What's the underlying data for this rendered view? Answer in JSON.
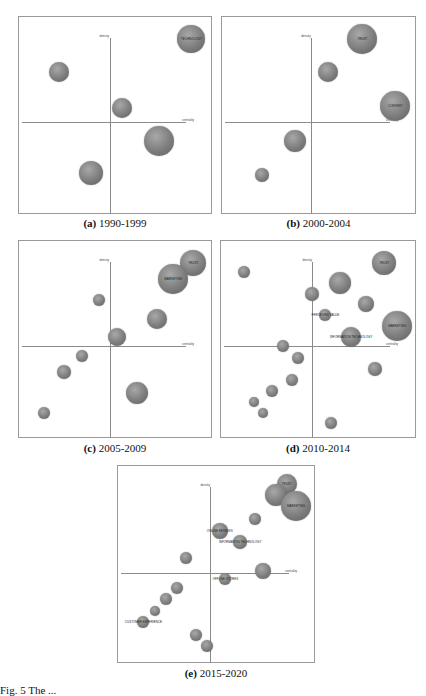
{
  "chart_data": [
    {
      "type": "scatter",
      "subtype": "strategic-diagram-bubble",
      "panel_id": "(a)",
      "title": "1990-1999",
      "xlabel": "centrality",
      "ylabel": "density",
      "grid": false,
      "points": [
        {
          "label": "TECHNOLOGY",
          "x": 0.92,
          "y": 0.09,
          "r": 14
        },
        {
          "label": "",
          "x": 0.19,
          "y": 0.27,
          "r": 10
        },
        {
          "label": "",
          "x": 0.54,
          "y": 0.46,
          "r": 10
        },
        {
          "label": "",
          "x": 0.74,
          "y": 0.64,
          "r": 15
        },
        {
          "label": "",
          "x": 0.37,
          "y": 0.81,
          "r": 12
        }
      ],
      "axis_origin": {
        "x": 0.47,
        "y": 0.54
      }
    },
    {
      "type": "scatter",
      "subtype": "strategic-diagram-bubble",
      "panel_id": "(b)",
      "title": "2000-2004",
      "xlabel": "centrality",
      "ylabel": "density",
      "grid": false,
      "points": [
        {
          "label": "TRUST",
          "x": 0.74,
          "y": 0.09,
          "r": 15
        },
        {
          "label": "",
          "x": 0.55,
          "y": 0.27,
          "r": 10
        },
        {
          "label": "CONTENT",
          "x": 0.92,
          "y": 0.45,
          "r": 15
        },
        {
          "label": "",
          "x": 0.37,
          "y": 0.64,
          "r": 11
        },
        {
          "label": "",
          "x": 0.19,
          "y": 0.82,
          "r": 7
        }
      ],
      "axis_origin": {
        "x": 0.46,
        "y": 0.54
      }
    },
    {
      "type": "scatter",
      "subtype": "strategic-diagram-bubble",
      "panel_id": "(c)",
      "title": "2005-2009",
      "xlabel": "centrality",
      "ylabel": "density",
      "grid": false,
      "points": [
        {
          "label": "TRUST",
          "x": 0.93,
          "y": 0.09,
          "r": 13
        },
        {
          "label": "MARKETING",
          "x": 0.82,
          "y": 0.18,
          "r": 15
        },
        {
          "label": "",
          "x": 0.41,
          "y": 0.29,
          "r": 6
        },
        {
          "label": "",
          "x": 0.73,
          "y": 0.39,
          "r": 10
        },
        {
          "label": "",
          "x": 0.51,
          "y": 0.49,
          "r": 9
        },
        {
          "label": "",
          "x": 0.32,
          "y": 0.59,
          "r": 6
        },
        {
          "label": "",
          "x": 0.22,
          "y": 0.68,
          "r": 7
        },
        {
          "label": "",
          "x": 0.62,
          "y": 0.79,
          "r": 11
        },
        {
          "label": "",
          "x": 0.11,
          "y": 0.9,
          "r": 6
        }
      ],
      "axis_origin": {
        "x": 0.47,
        "y": 0.54
      }
    },
    {
      "type": "scatter",
      "subtype": "strategic-diagram-bubble",
      "panel_id": "(d)",
      "title": "2010-2014",
      "xlabel": "centrality",
      "ylabel": "density",
      "grid": false,
      "points": [
        {
          "label": "TRUST",
          "x": 0.86,
          "y": 0.09,
          "r": 12
        },
        {
          "label": "",
          "x": 0.1,
          "y": 0.14,
          "r": 6
        },
        {
          "label": "",
          "x": 0.62,
          "y": 0.2,
          "r": 11
        },
        {
          "label": "",
          "x": 0.47,
          "y": 0.26,
          "r": 7
        },
        {
          "label": "",
          "x": 0.76,
          "y": 0.31,
          "r": 8
        },
        {
          "label": "PERCEIVED VALUE",
          "x": 0.54,
          "y": 0.37,
          "r": 6
        },
        {
          "label": "MARKETING",
          "x": 0.93,
          "y": 0.43,
          "r": 15
        },
        {
          "label": "INFORMATION TECHNOLOGY",
          "x": 0.68,
          "y": 0.49,
          "r": 10
        },
        {
          "label": "",
          "x": 0.31,
          "y": 0.54,
          "r": 6
        },
        {
          "label": "",
          "x": 0.39,
          "y": 0.6,
          "r": 6
        },
        {
          "label": "",
          "x": 0.81,
          "y": 0.66,
          "r": 7
        },
        {
          "label": "",
          "x": 0.36,
          "y": 0.72,
          "r": 6
        },
        {
          "label": "",
          "x": 0.25,
          "y": 0.78,
          "r": 6
        },
        {
          "label": "",
          "x": 0.15,
          "y": 0.84,
          "r": 5
        },
        {
          "label": "",
          "x": 0.2,
          "y": 0.9,
          "r": 5
        },
        {
          "label": "",
          "x": 0.57,
          "y": 0.95,
          "r": 6
        }
      ],
      "axis_origin": {
        "x": 0.47,
        "y": 0.54
      }
    },
    {
      "type": "scatter",
      "subtype": "strategic-diagram-bubble",
      "panel_id": "(e)",
      "title": "2015-2020",
      "xlabel": "centrality",
      "ylabel": "density",
      "grid": false,
      "points": [
        {
          "label": "TRUST",
          "x": 0.88,
          "y": 0.07,
          "r": 10
        },
        {
          "label": "",
          "x": 0.82,
          "y": 0.13,
          "r": 11
        },
        {
          "label": "MARKETING",
          "x": 0.93,
          "y": 0.19,
          "r": 15
        },
        {
          "label": "",
          "x": 0.71,
          "y": 0.26,
          "r": 6
        },
        {
          "label": "ONLINE REVIEWS",
          "x": 0.52,
          "y": 0.32,
          "r": 8
        },
        {
          "label": "INFORMATION TECHNOLOGY",
          "x": 0.63,
          "y": 0.38,
          "r": 7
        },
        {
          "label": "",
          "x": 0.34,
          "y": 0.47,
          "r": 6
        },
        {
          "label": "",
          "x": 0.75,
          "y": 0.54,
          "r": 8
        },
        {
          "label": "OFFLINE STORES",
          "x": 0.55,
          "y": 0.58,
          "r": 6
        },
        {
          "label": "",
          "x": 0.29,
          "y": 0.63,
          "r": 6
        },
        {
          "label": "",
          "x": 0.23,
          "y": 0.69,
          "r": 6
        },
        {
          "label": "",
          "x": 0.17,
          "y": 0.75,
          "r": 5
        },
        {
          "label": "CUSTOMER EXPERIENCE",
          "x": 0.11,
          "y": 0.81,
          "r": 6
        },
        {
          "label": "",
          "x": 0.39,
          "y": 0.88,
          "r": 6
        },
        {
          "label": "",
          "x": 0.45,
          "y": 0.94,
          "r": 6
        }
      ],
      "axis_origin": {
        "x": 0.47,
        "y": 0.55
      }
    }
  ],
  "panels": [
    {
      "id": "a",
      "caption_letter": "(a)",
      "caption_years": "1990-1999",
      "axis_x_label": "centrality",
      "axis_y_label": "density"
    },
    {
      "id": "b",
      "caption_letter": "(b)",
      "caption_years": "2000-2004",
      "axis_x_label": "centrality",
      "axis_y_label": "density"
    },
    {
      "id": "c",
      "caption_letter": "(c)",
      "caption_years": "2005-2009",
      "axis_x_label": "centrality",
      "axis_y_label": "density"
    },
    {
      "id": "d",
      "caption_letter": "(d)",
      "caption_years": "2010-2014",
      "axis_x_label": "centrality",
      "axis_y_label": "density"
    },
    {
      "id": "e",
      "caption_letter": "(e)",
      "caption_years": "2015-2020",
      "axis_x_label": "centrality",
      "axis_y_label": "density"
    }
  ],
  "figure_caption": "Fig. 5  The ..."
}
